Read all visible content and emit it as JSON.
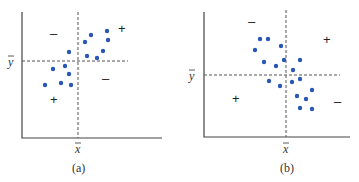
{
  "chart_data": [
    {
      "type": "scatter",
      "title": "",
      "caption": "(a)",
      "xlabel": "x̄",
      "ylabel": "ȳ",
      "grid": false,
      "description": "Positive association: points mostly in upper-right (+) and lower-left (+) quadrants relative to the means",
      "quadrant_signs": {
        "upper_left": "–",
        "upper_right": "+",
        "lower_left": "+",
        "lower_right": "–"
      },
      "points_px": [
        [
          45,
          85
        ],
        [
          53,
          69
        ],
        [
          61,
          83
        ],
        [
          65,
          66
        ],
        [
          69,
          74
        ],
        [
          71,
          85
        ],
        [
          69,
          52
        ],
        [
          85,
          42
        ],
        [
          91,
          35
        ],
        [
          87,
          56
        ],
        [
          97,
          58
        ],
        [
          103,
          51
        ],
        [
          107,
          31
        ],
        [
          108,
          40
        ]
      ],
      "axes_px": {
        "left": 22,
        "bottom": 138,
        "top": 12,
        "right": 162,
        "mean_x": 78,
        "mean_y": 61
      },
      "sign_pos_px": {
        "upper_left": [
          54,
          38
        ],
        "upper_right": [
          122,
          33
        ],
        "lower_left": [
          54,
          103
        ],
        "lower_right": [
          106,
          83
        ]
      }
    },
    {
      "type": "scatter",
      "title": "",
      "caption": "(b)",
      "xlabel": "x̄",
      "ylabel": "ȳ",
      "grid": false,
      "description": "Negative association: points mostly in upper-left (–) and lower-right (–) quadrants relative to the means",
      "quadrant_signs": {
        "upper_left": "–",
        "upper_right": "+",
        "lower_left": "+",
        "lower_right": "–"
      },
      "points_px": [
        [
          260,
          39
        ],
        [
          268,
          39
        ],
        [
          281,
          46
        ],
        [
          255,
          50
        ],
        [
          264,
          62
        ],
        [
          276,
          66
        ],
        [
          284,
          60
        ],
        [
          300,
          60
        ],
        [
          293,
          70
        ],
        [
          269,
          81
        ],
        [
          280,
          86
        ],
        [
          292,
          82
        ],
        [
          300,
          79
        ],
        [
          312,
          90
        ],
        [
          297,
          96
        ],
        [
          306,
          99
        ],
        [
          300,
          108
        ],
        [
          312,
          109
        ]
      ],
      "axes_px": {
        "left": 204,
        "bottom": 137,
        "top": 12,
        "right": 350,
        "mean_x": 286,
        "mean_y": 75
      },
      "sign_pos_px": {
        "upper_left": [
          252,
          26
        ],
        "upper_right": [
          327,
          44
        ],
        "lower_left": [
          236,
          103
        ],
        "lower_right": [
          338,
          105
        ]
      }
    }
  ],
  "labels": {
    "a": {
      "xbar": "x",
      "ybar": "y",
      "caption": "(a)",
      "signs": [
        "–",
        "+",
        "+",
        "–"
      ]
    },
    "b": {
      "xbar": "x",
      "ybar": "y",
      "caption": "(b)",
      "signs": [
        "–",
        "+",
        "+",
        "–"
      ]
    }
  }
}
